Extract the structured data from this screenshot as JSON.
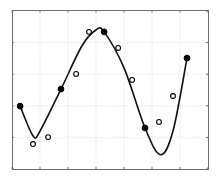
{
  "chart_data": {
    "type": "scatter",
    "title": "",
    "xlabel": "",
    "ylabel": "",
    "xlim": [
      0,
      7
    ],
    "ylim": [
      0,
      5
    ],
    "grid": true,
    "legend": null,
    "x_ticks": [
      0,
      1,
      2,
      3,
      4,
      5,
      6,
      7
    ],
    "y_ticks": [
      0,
      1,
      2,
      3,
      4,
      5
    ],
    "tick_labels_visible": false,
    "series": [
      {
        "name": "fitted-curve",
        "kind": "line",
        "color": "#111111",
        "x": [
          0.29,
          0.75,
          1.0,
          1.75,
          2.5,
          3.0,
          3.29,
          4.0,
          4.75,
          5.3,
          5.75,
          6.25
        ],
        "y": [
          1.99,
          1.05,
          1.2,
          2.53,
          3.9,
          4.4,
          4.34,
          3.2,
          1.3,
          0.45,
          1.2,
          3.51
        ]
      },
      {
        "name": "knots",
        "kind": "scatter",
        "marker": "filled-circle",
        "color": "#000000",
        "x": [
          0.29,
          1.75,
          3.29,
          4.75,
          6.25
        ],
        "y": [
          1.99,
          2.53,
          4.34,
          1.3,
          3.51
        ]
      },
      {
        "name": "samples",
        "kind": "scatter",
        "marker": "open-circle",
        "color": "#000000",
        "x": [
          0.75,
          1.29,
          2.29,
          2.75,
          3.79,
          4.29,
          5.25,
          5.75
        ],
        "y": [
          0.79,
          1.01,
          3.01,
          4.34,
          3.83,
          2.82,
          1.49,
          2.31
        ]
      }
    ]
  },
  "plot": {
    "px_left": 12,
    "px_right": 208,
    "px_top": 11,
    "px_bottom": 169
  }
}
